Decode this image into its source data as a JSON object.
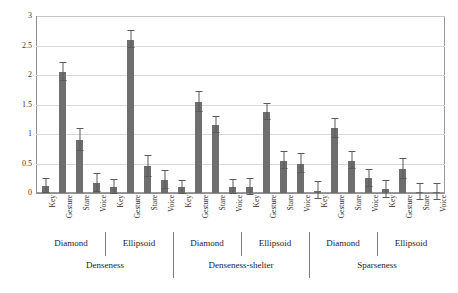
{
  "chart_data": {
    "type": "bar",
    "title": "",
    "xlabel": "",
    "ylabel": "",
    "ylim": [
      0,
      3
    ],
    "yticks": [
      "0",
      "0.5",
      "1",
      "1.5",
      "2",
      "2.5",
      "3"
    ],
    "ytick_values": [
      0,
      0.5,
      1,
      1.5,
      2,
      2.5,
      3
    ],
    "grid": true,
    "legend": "none",
    "bar_color": "#6e6e6e",
    "error_color": "#5a5a5a",
    "categories": [
      "Key",
      "Gesture",
      "Stare",
      "Voice"
    ],
    "subgroups": [
      "Diamond",
      "Ellipsoid"
    ],
    "groups": [
      "Denseness",
      "Denseness-shelter",
      "Sparseness"
    ],
    "bars": [
      {
        "group": "Denseness",
        "subgroup": "Diamond",
        "category": "Key",
        "value": 0.12,
        "error": 0.12
      },
      {
        "group": "Denseness",
        "subgroup": "Diamond",
        "category": "Gesture",
        "value": 2.05,
        "error": 0.15
      },
      {
        "group": "Denseness",
        "subgroup": "Diamond",
        "category": "Stare",
        "value": 0.9,
        "error": 0.18
      },
      {
        "group": "Denseness",
        "subgroup": "Diamond",
        "category": "Voice",
        "value": 0.17,
        "error": 0.15
      },
      {
        "group": "Denseness",
        "subgroup": "Ellipsoid",
        "category": "Key",
        "value": 0.1,
        "error": 0.12
      },
      {
        "group": "Denseness",
        "subgroup": "Ellipsoid",
        "category": "Gesture",
        "value": 2.6,
        "error": 0.14
      },
      {
        "group": "Denseness",
        "subgroup": "Ellipsoid",
        "category": "Stare",
        "value": 0.45,
        "error": 0.18
      },
      {
        "group": "Denseness",
        "subgroup": "Ellipsoid",
        "category": "Voice",
        "value": 0.22,
        "error": 0.16
      },
      {
        "group": "Denseness-shelter",
        "subgroup": "Diamond",
        "category": "Key",
        "value": 0.1,
        "error": 0.11
      },
      {
        "group": "Denseness-shelter",
        "subgroup": "Diamond",
        "category": "Gesture",
        "value": 1.55,
        "error": 0.17
      },
      {
        "group": "Denseness-shelter",
        "subgroup": "Diamond",
        "category": "Stare",
        "value": 1.15,
        "error": 0.14
      },
      {
        "group": "Denseness-shelter",
        "subgroup": "Diamond",
        "category": "Voice",
        "value": 0.1,
        "error": 0.12
      },
      {
        "group": "Denseness-shelter",
        "subgroup": "Ellipsoid",
        "category": "Key",
        "value": 0.1,
        "error": 0.13
      },
      {
        "group": "Denseness-shelter",
        "subgroup": "Ellipsoid",
        "category": "Gesture",
        "value": 1.37,
        "error": 0.14
      },
      {
        "group": "Denseness-shelter",
        "subgroup": "Ellipsoid",
        "category": "Stare",
        "value": 0.55,
        "error": 0.14
      },
      {
        "group": "Denseness-shelter",
        "subgroup": "Ellipsoid",
        "category": "Voice",
        "value": 0.5,
        "error": 0.16
      },
      {
        "group": "Sparseness",
        "subgroup": "Diamond",
        "category": "Key",
        "value": 0.04,
        "error": 0.14
      },
      {
        "group": "Sparseness",
        "subgroup": "Diamond",
        "category": "Gesture",
        "value": 1.1,
        "error": 0.16
      },
      {
        "group": "Sparseness",
        "subgroup": "Diamond",
        "category": "Stare",
        "value": 0.55,
        "error": 0.15
      },
      {
        "group": "Sparseness",
        "subgroup": "Diamond",
        "category": "Voice",
        "value": 0.25,
        "error": 0.14
      },
      {
        "group": "Sparseness",
        "subgroup": "Ellipsoid",
        "category": "Key",
        "value": 0.06,
        "error": 0.14
      },
      {
        "group": "Sparseness",
        "subgroup": "Ellipsoid",
        "category": "Gesture",
        "value": 0.4,
        "error": 0.17
      },
      {
        "group": "Sparseness",
        "subgroup": "Ellipsoid",
        "category": "Stare",
        "value": 0.02,
        "error": 0.14
      },
      {
        "group": "Sparseness",
        "subgroup": "Ellipsoid",
        "category": "Voice",
        "value": 0.02,
        "error": 0.14
      }
    ]
  }
}
